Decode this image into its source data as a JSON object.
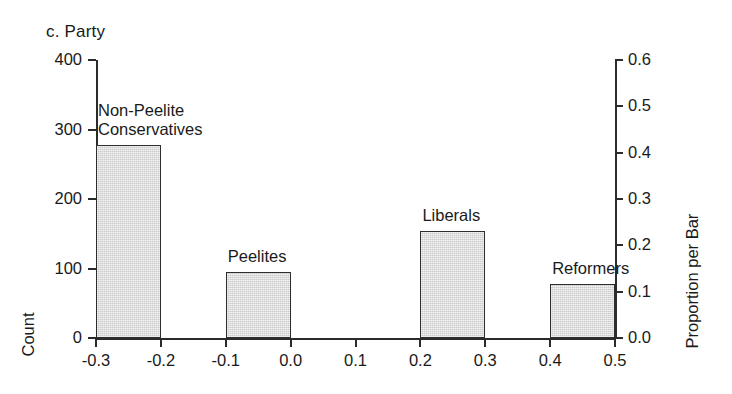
{
  "chart_data": {
    "type": "bar",
    "title": "c. Party",
    "xlabel": "",
    "ylabel": "Count",
    "y2label": "Proportion per Bar",
    "xlim": [
      -0.35,
      0.55
    ],
    "ylim": [
      0,
      400
    ],
    "y2lim": [
      0.0,
      0.6
    ],
    "grid": false,
    "legend": "none",
    "bin_width": 0.1,
    "xticks": [
      "-0.3",
      "-0.2",
      "-0.1",
      "0.0",
      "0.1",
      "0.2",
      "0.3",
      "0.4",
      "0.5"
    ],
    "xtick_values": [
      -0.3,
      -0.2,
      -0.1,
      0.0,
      0.1,
      0.2,
      0.3,
      0.4,
      0.5
    ],
    "yticks": [
      "0",
      "100",
      "200",
      "300",
      "400"
    ],
    "ytick_values": [
      0,
      100,
      200,
      300,
      400
    ],
    "y2ticks": [
      "0.0",
      "0.1",
      "0.2",
      "0.3",
      "0.4",
      "0.5",
      "0.6"
    ],
    "y2tick_values": [
      0.0,
      0.1,
      0.2,
      0.3,
      0.4,
      0.5,
      0.6
    ],
    "bars": [
      {
        "label": "Non-Peelite\nConservatives",
        "x0": -0.3,
        "x1": -0.2,
        "count": 277,
        "proportion": 0.45
      },
      {
        "label": "Peelites",
        "x0": -0.1,
        "x1": 0.0,
        "count": 95,
        "proportion": 0.155
      },
      {
        "label": "Liberals",
        "x0": 0.2,
        "x1": 0.3,
        "count": 154,
        "proportion": 0.25
      },
      {
        "label": "Reformers",
        "x0": 0.4,
        "x1": 0.5,
        "count": 78,
        "proportion": 0.127
      }
    ],
    "categories": [
      "Non-Peelite Conservatives",
      "Peelites",
      "Liberals",
      "Reformers"
    ],
    "values": [
      277,
      95,
      154,
      78
    ],
    "colors": {
      "bar_fill": "#cbcbcb",
      "bar_stroke": "#2e2e2e",
      "axis": "#2b2b2b",
      "text": "#1a1a1a",
      "background": "#ffffff"
    }
  }
}
